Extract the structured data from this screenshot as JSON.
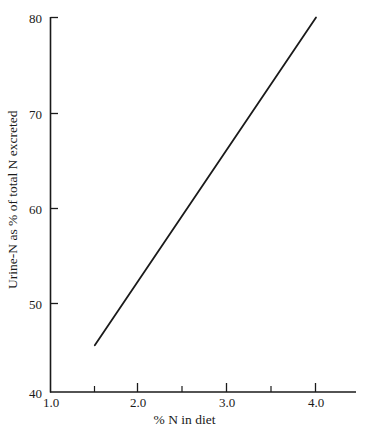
{
  "chart_data": {
    "type": "line",
    "title": "",
    "xlabel": "% N in diet",
    "ylabel": "Urine-N as % of total N excreted",
    "xlim": [
      1.0,
      4.5
    ],
    "ylim": [
      40,
      80
    ],
    "grid": false,
    "legend": null,
    "xticks": [
      {
        "value": 1.0,
        "label": "1.0",
        "major": true
      },
      {
        "value": 1.5,
        "label": "",
        "major": false
      },
      {
        "value": 2.0,
        "label": "2.0",
        "major": true
      },
      {
        "value": 2.5,
        "label": "",
        "major": false
      },
      {
        "value": 3.0,
        "label": "3.0",
        "major": true
      },
      {
        "value": 3.5,
        "label": "",
        "major": false
      },
      {
        "value": 4.0,
        "label": "4.0",
        "major": true
      }
    ],
    "yticks": [
      {
        "value": 40,
        "label": "40",
        "major": true
      },
      {
        "value": 50,
        "label": "50",
        "major": true
      },
      {
        "value": 60,
        "label": "60",
        "major": true
      },
      {
        "value": 70,
        "label": "70",
        "major": true
      },
      {
        "value": 80,
        "label": "80",
        "major": true
      }
    ],
    "series": [
      {
        "name": "Urine-N",
        "color": "#1a1a1a",
        "x": [
          1.5,
          4.0
        ],
        "values": [
          45,
          80
        ],
        "points": [
          [
            1.5,
            45
          ],
          [
            4.0,
            80
          ]
        ]
      }
    ]
  },
  "labels": {
    "x_axis_title": "% N in diet",
    "y_axis_title": "Urine-N as % of total N excreted",
    "y_80": "80",
    "y_70": "70",
    "y_60": "60",
    "y_50": "50",
    "y_40": "40",
    "x_10": "1.0",
    "x_20": "2.0",
    "x_30": "3.0",
    "x_40": "4.0"
  },
  "colors": {
    "axis": "#1a1a1a",
    "line": "#1a1a1a",
    "background": "#ffffff"
  }
}
